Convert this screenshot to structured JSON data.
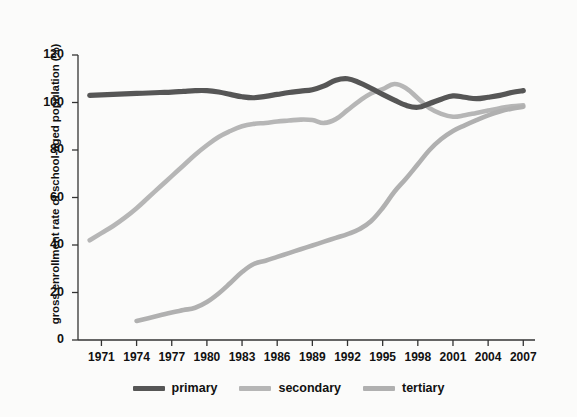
{
  "chart_data": {
    "type": "line",
    "title": "",
    "subtitle": "",
    "xlabel": "",
    "ylabel": "gross enrollment rate of school-aged population (%)",
    "xlim": [
      1969,
      2008
    ],
    "ylim": [
      0,
      120
    ],
    "ytick_labels": [
      "0",
      "20",
      "40",
      "60",
      "80",
      "100",
      "120"
    ],
    "yticks": [
      0,
      20,
      40,
      60,
      80,
      100,
      120
    ],
    "xtick_labels": [
      "1971",
      "1974",
      "1977",
      "1980",
      "1983",
      "1986",
      "1989",
      "1992",
      "1995",
      "1998",
      "2001",
      "2004",
      "2007"
    ],
    "xticks": [
      1971,
      1974,
      1977,
      1980,
      1983,
      1986,
      1989,
      1992,
      1995,
      1998,
      2001,
      2004,
      2007
    ],
    "grid": false,
    "legend_position": "bottom",
    "series": [
      {
        "name": "primary",
        "color": "#565656",
        "x": [
          1970,
          1971,
          1972,
          1973,
          1974,
          1975,
          1976,
          1977,
          1978,
          1979,
          1980,
          1981,
          1982,
          1983,
          1984,
          1985,
          1986,
          1987,
          1988,
          1989,
          1990,
          1991,
          1992,
          1993,
          1994,
          1995,
          1996,
          1997,
          1998,
          1999,
          2000,
          2001,
          2002,
          2003,
          2004,
          2005,
          2006,
          2007
        ],
        "values": [
          103.0,
          103.2,
          103.4,
          103.6,
          103.8,
          104.0,
          104.2,
          104.4,
          104.7,
          105.0,
          105.0,
          104.4,
          103.4,
          102.4,
          102.0,
          102.6,
          103.4,
          104.2,
          104.8,
          105.4,
          107.0,
          109.4,
          110.0,
          108.4,
          106.0,
          103.4,
          101.0,
          98.8,
          98.0,
          99.6,
          101.4,
          102.8,
          102.2,
          101.6,
          102.2,
          103.0,
          104.2,
          105.0
        ]
      },
      {
        "name": "secondary",
        "color": "#b6b6b6",
        "x": [
          1970,
          1971,
          1972,
          1973,
          1974,
          1975,
          1976,
          1977,
          1978,
          1979,
          1980,
          1981,
          1982,
          1983,
          1984,
          1985,
          1986,
          1987,
          1988,
          1989,
          1990,
          1991,
          1992,
          1993,
          1994,
          1995,
          1996,
          1997,
          1998,
          1999,
          2000,
          2001,
          2002,
          2003,
          2004,
          2005,
          2006,
          2007
        ],
        "values": [
          42.0,
          45.0,
          48.0,
          51.5,
          55.5,
          60.0,
          64.5,
          69.0,
          73.5,
          78.0,
          82.0,
          85.5,
          88.0,
          90.0,
          91.0,
          91.4,
          92.0,
          92.4,
          92.8,
          92.6,
          91.4,
          93.0,
          96.8,
          100.6,
          103.8,
          105.6,
          107.8,
          106.0,
          101.8,
          97.6,
          95.2,
          94.0,
          94.6,
          95.6,
          96.6,
          97.6,
          98.4,
          98.8
        ]
      },
      {
        "name": "tertiary",
        "color": "#b0b0b0",
        "x": [
          1974,
          1975,
          1976,
          1977,
          1978,
          1979,
          1980,
          1981,
          1982,
          1983,
          1984,
          1985,
          1986,
          1987,
          1988,
          1989,
          1990,
          1991,
          1992,
          1993,
          1994,
          1995,
          1996,
          1997,
          1998,
          1999,
          2000,
          2001,
          2002,
          2003,
          2004,
          2005,
          2006,
          2007
        ],
        "values": [
          8.0,
          9.2,
          10.4,
          11.6,
          12.6,
          13.6,
          16.0,
          19.6,
          24.0,
          28.6,
          32.0,
          33.4,
          35.0,
          36.6,
          38.2,
          39.8,
          41.4,
          43.0,
          44.6,
          46.6,
          50.0,
          55.6,
          62.4,
          68.0,
          74.0,
          80.0,
          84.6,
          88.0,
          90.4,
          92.6,
          94.6,
          96.2,
          97.4,
          98.2
        ]
      }
    ]
  },
  "legend": {
    "items": [
      {
        "label": "primary",
        "color": "#565656"
      },
      {
        "label": "secondary",
        "color": "#b6b6b6"
      },
      {
        "label": "tertiary",
        "color": "#b0b0b0"
      }
    ]
  },
  "axis": {
    "color": "#333333"
  }
}
